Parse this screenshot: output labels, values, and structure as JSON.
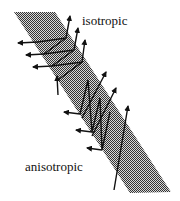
{
  "labels": {
    "top": "isotropic",
    "bottom": "anisotropic"
  },
  "colors": {
    "band_fill": "#777777",
    "ink": "#111111"
  }
}
